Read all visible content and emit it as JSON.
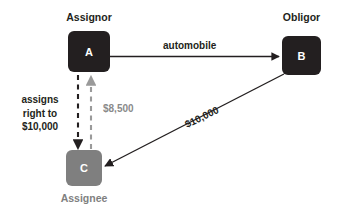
{
  "diagram": {
    "background_color": "#ffffff",
    "nodes": [
      {
        "id": "A",
        "letter": "A",
        "caption": "Assignor",
        "color": "#231f20",
        "text_color": "#ffffff",
        "caption_color": "#231f20",
        "caption_position": "above"
      },
      {
        "id": "B",
        "letter": "B",
        "caption": "Obligor",
        "color": "#231f20",
        "text_color": "#ffffff",
        "caption_color": "#231f20",
        "caption_position": "above"
      },
      {
        "id": "C",
        "letter": "C",
        "caption": "Assignee",
        "color": "#7f7f7f",
        "text_color": "#ffffff",
        "caption_color": "#7f7f7f",
        "caption_position": "below"
      }
    ],
    "edges": [
      {
        "from": "A",
        "to": "B",
        "label": "automobile",
        "style": "solid",
        "color": "#231f20",
        "label_color": "#231f20"
      },
      {
        "from": "A",
        "to": "C",
        "label": "assigns right to $10,000",
        "label_lines": [
          "assigns",
          "right to",
          "$10,000"
        ],
        "style": "dashed",
        "color": "#231f20",
        "label_color": "#231f20"
      },
      {
        "from": "C",
        "to": "A",
        "label": "$8,500",
        "style": "dashed",
        "color": "#8a8a8a",
        "label_color": "#8a8a8a"
      },
      {
        "from": "B",
        "to": "C",
        "label": "$10,000",
        "style": "solid",
        "color": "#231f20",
        "label_color": "#231f20"
      }
    ]
  }
}
